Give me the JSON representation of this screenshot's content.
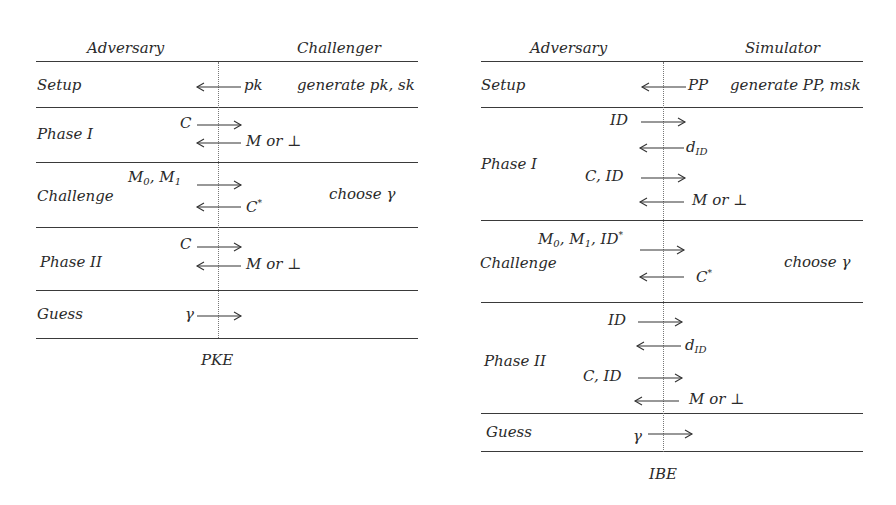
{
  "pke": {
    "caption": "PKE",
    "headers": {
      "left": "Adversary",
      "right": "Challenger"
    },
    "rows": [
      {
        "phase": "Setup",
        "messages": [
          {
            "dir": "left",
            "right_label": "pk"
          }
        ],
        "note": "generate pk, sk"
      },
      {
        "phase": "Phase I",
        "messages": [
          {
            "dir": "right",
            "left_label": "C"
          },
          {
            "dir": "left",
            "right_label": "M or ⊥"
          }
        ]
      },
      {
        "phase": "Challenge",
        "messages": [
          {
            "dir": "right",
            "left_label": "M0, M1"
          },
          {
            "dir": "left",
            "right_label": "C*"
          }
        ],
        "note": "choose γ"
      },
      {
        "phase": "Phase II",
        "messages": [
          {
            "dir": "right",
            "left_label": "C"
          },
          {
            "dir": "left",
            "right_label": "M or ⊥"
          }
        ]
      },
      {
        "phase": "Guess",
        "messages": [
          {
            "dir": "right",
            "left_label": "γ"
          }
        ]
      }
    ],
    "labels": {
      "setup": "Setup",
      "pk": "pk",
      "gen": "generate pk, sk",
      "phase1": "Phase I",
      "c1": "C",
      "mor1": "M or ⊥",
      "challenge": "Challenge",
      "m0": "M",
      "m0sub": "0",
      "m1": "M",
      "m1sub": "1",
      "comma": ",",
      "cstar": "C",
      "star": "*",
      "choose": "choose γ",
      "phase2": "Phase II",
      "c2": "C",
      "mor2": "M or ⊥",
      "guess": "Guess",
      "gamma": "γ"
    }
  },
  "ibe": {
    "caption": "IBE",
    "headers": {
      "left": "Adversary",
      "right": "Simulator"
    },
    "rows": [
      {
        "phase": "Setup",
        "messages": [
          {
            "dir": "left",
            "right_label": "PP"
          }
        ],
        "note": "generate PP, msk"
      },
      {
        "phase": "Phase I",
        "messages": [
          {
            "dir": "right",
            "left_label": "ID"
          },
          {
            "dir": "left",
            "right_label": "d_ID"
          },
          {
            "dir": "right",
            "left_label": "C, ID"
          },
          {
            "dir": "left",
            "right_label": "M or ⊥"
          }
        ]
      },
      {
        "phase": "Challenge",
        "messages": [
          {
            "dir": "right",
            "left_label": "M0, M1, ID*"
          },
          {
            "dir": "left",
            "right_label": "C*"
          }
        ],
        "note": "choose γ"
      },
      {
        "phase": "Phase II",
        "messages": [
          {
            "dir": "right",
            "left_label": "ID"
          },
          {
            "dir": "left",
            "right_label": "d_ID"
          },
          {
            "dir": "right",
            "left_label": "C, ID"
          },
          {
            "dir": "left",
            "right_label": "M or ⊥"
          }
        ]
      },
      {
        "phase": "Guess",
        "messages": [
          {
            "dir": "right",
            "left_label": "γ"
          }
        ]
      }
    ],
    "labels": {
      "setup": "Setup",
      "pp": "PP",
      "gen": "generate PP, msk",
      "phase1": "Phase I",
      "id1": "ID",
      "d": "d",
      "idsub": "ID",
      "cid1": "C, ID",
      "mor1": "M or ⊥",
      "challenge": "Challenge",
      "m": "M",
      "m0sub": "0",
      "m1sub": "1",
      "ids": "ID",
      "star": "*",
      "cstar": "C",
      "choose": "choose γ",
      "phase2": "Phase II",
      "id2": "ID",
      "cid2": "C, ID",
      "mor2": "M or ⊥",
      "guess": "Guess",
      "gamma": "γ"
    }
  }
}
